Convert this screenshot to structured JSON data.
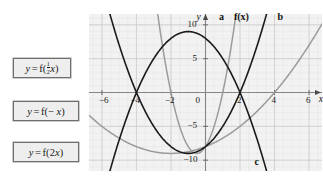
{
  "choices": [
    {
      "id": "half",
      "text": "y = f(½x)",
      "lhs": "y",
      "eq": "=",
      "fn": "f(",
      "coef": "½",
      "var": "x",
      "close": ")"
    },
    {
      "id": "negate",
      "text": "y = f(−x)",
      "lhs": "y",
      "eq": "=",
      "fn": "f(− ",
      "var": "x",
      "close": ")"
    },
    {
      "id": "double",
      "text": "y = f(2x)",
      "lhs": "y",
      "eq": "=",
      "fn": "f(2",
      "var": "x",
      "close": ")"
    }
  ],
  "choice_labels": {
    "y": "y",
    "equals": "=",
    "f_open": "f(",
    "f_open_neg": "f(− ",
    "f_open_two": "f(2",
    "x": "x",
    "close": ")",
    "frac_num": "1",
    "frac_den": "2"
  },
  "plot": {
    "x_axis_label": "x",
    "y_axis_label": "y",
    "x_ticks": [
      "−6",
      "−4",
      "−2",
      "0",
      "2",
      "4",
      "6"
    ],
    "y_ticks": [
      "10",
      "5",
      "−5",
      "−10"
    ],
    "origin_label": "0",
    "curve_labels": [
      {
        "name": "a",
        "text": "a"
      },
      {
        "name": "fx",
        "text": "f(x)"
      },
      {
        "name": "b",
        "text": "b"
      },
      {
        "name": "c",
        "text": "c"
      }
    ],
    "colors": {
      "background": "#f2f2f2",
      "minor_grid": "#e2e2e2",
      "major_grid": "#c8c8c8",
      "axis": "#7a7a7a",
      "curve_dark": "#1a1a1a",
      "curve_light": "#9b9b9b"
    }
  },
  "chart_data": {
    "type": "line",
    "title": "",
    "xlabel": "x",
    "ylabel": "y",
    "xlim": [
      -6.6,
      6.6
    ],
    "ylim": [
      -11.5,
      11.5
    ],
    "xticks": [
      -6,
      -4,
      -2,
      0,
      2,
      4,
      6
    ],
    "yticks": [
      10,
      5,
      -5,
      -10
    ],
    "grid": true,
    "minor_grid_step": 0.5,
    "legend": "inline-curve-labels",
    "series": [
      {
        "name": "f(x)",
        "label": "f(x)",
        "color": "#1a1a1a",
        "equation": "y = (x + 4)(x - 2) = x^2 + 2x - 8",
        "roots": [
          -4,
          2
        ],
        "vertex": [
          -1,
          -9
        ],
        "opens": "up",
        "x": [
          -6,
          -5,
          -4,
          -3,
          -2,
          -1,
          0,
          1,
          2,
          3,
          4
        ],
        "y": [
          16,
          7,
          0,
          -5,
          -8,
          -9,
          -8,
          -5,
          0,
          7,
          16
        ]
      },
      {
        "name": "a",
        "label": "a",
        "color": "#9b9b9b",
        "equation": "y = f(2x) = 4x^2 + 4x - 8",
        "roots": [
          -2,
          1
        ],
        "vertex": [
          -0.5,
          -9
        ],
        "opens": "up",
        "x": [
          -3,
          -2.5,
          -2,
          -1.5,
          -1,
          -0.5,
          0,
          0.5,
          1,
          1.5,
          2
        ],
        "y": [
          16,
          7,
          0,
          -5,
          -8,
          -9,
          -8,
          -5,
          0,
          7,
          16
        ]
      },
      {
        "name": "b",
        "label": "b",
        "color": "#9b9b9b",
        "equation": "y = f(½x) = 0.25x^2 + x - 8",
        "roots": [
          -8,
          4
        ],
        "vertex": [
          -2,
          -9
        ],
        "opens": "up",
        "x": [
          -6,
          -5,
          -4,
          -3,
          -2,
          -1,
          0,
          1,
          2,
          3,
          4,
          5,
          6
        ],
        "y": [
          -5,
          -6.75,
          -8,
          -8.75,
          -9,
          -8.75,
          -8,
          -6.75,
          -5,
          -2.75,
          0,
          3.25,
          7
        ]
      },
      {
        "name": "c",
        "label": "c",
        "color": "#1a1a1a",
        "equation": "y = -f(x) reflected / f(-x) family = -(x^2 + 2x - 8)",
        "roots": [
          -4,
          2
        ],
        "vertex": [
          -1,
          9
        ],
        "opens": "down",
        "x": [
          -5,
          -4,
          -3,
          -2,
          -1,
          0,
          1,
          2,
          3
        ],
        "y": [
          -7,
          0,
          5,
          8,
          9,
          8,
          5,
          0,
          -7
        ]
      }
    ]
  }
}
